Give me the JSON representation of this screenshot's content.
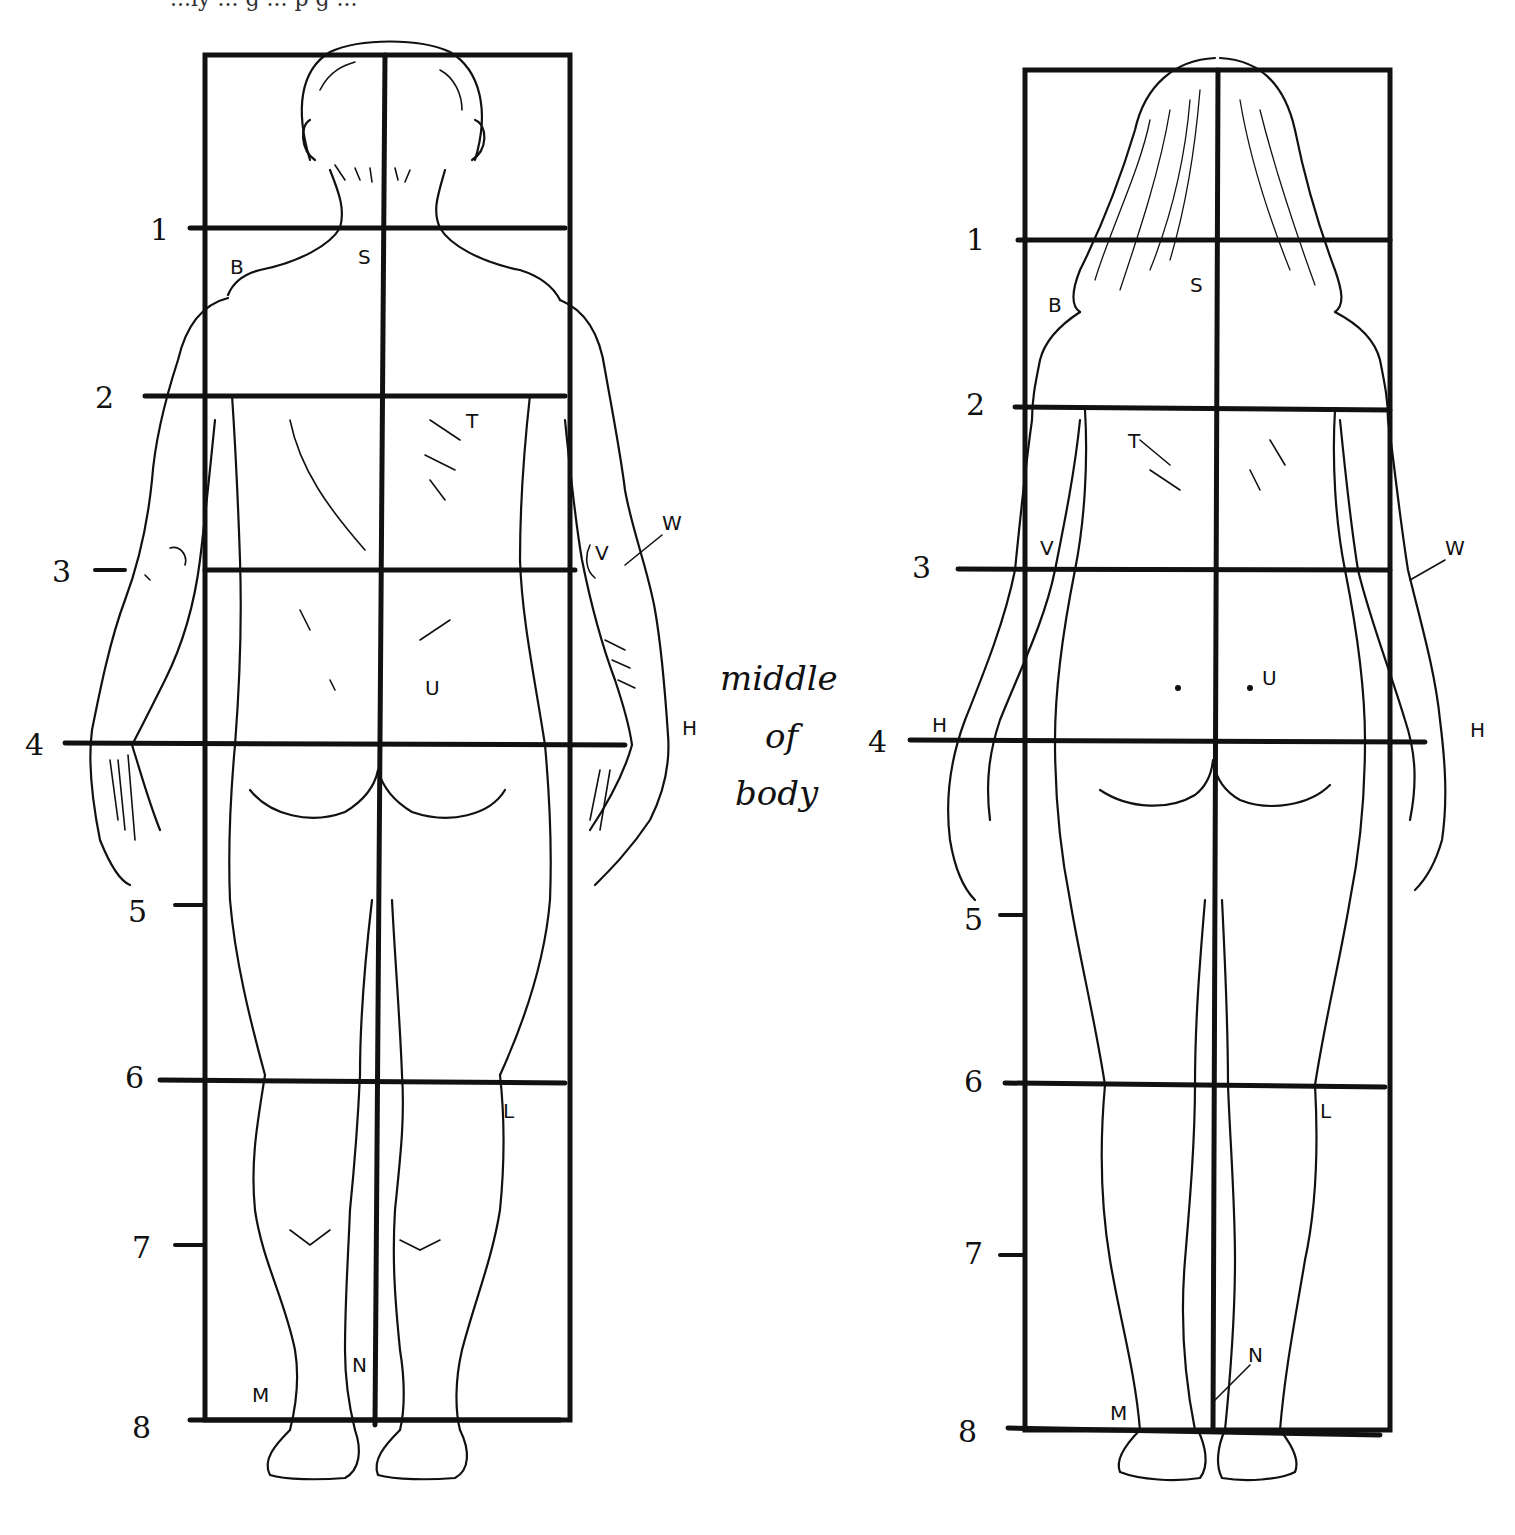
{
  "page": {
    "top_partial_text": "...ly ... g ... p g ...",
    "center_note": [
      "middle",
      "of",
      "body"
    ]
  },
  "figures": [
    {
      "id": "male",
      "view": "back",
      "grid_rows": [
        "1",
        "2",
        "3",
        "4",
        "5",
        "6",
        "7",
        "8"
      ],
      "landmarks": {
        "B": "B",
        "S": "S",
        "T": "T",
        "V": "V",
        "W": "W",
        "U": "U",
        "H": "H",
        "L": "L",
        "M": "M",
        "N": "N"
      }
    },
    {
      "id": "female",
      "view": "back",
      "grid_rows": [
        "1",
        "2",
        "3",
        "4",
        "5",
        "6",
        "7",
        "8"
      ],
      "landmarks": {
        "B": "B",
        "S": "S",
        "T": "T",
        "V": "V",
        "W": "W",
        "U": "U",
        "H_left": "H",
        "H_right": "H",
        "L": "L",
        "M": "M",
        "N": "N"
      }
    }
  ],
  "colors": {
    "ink": "#111111",
    "paper": "#ffffff"
  }
}
